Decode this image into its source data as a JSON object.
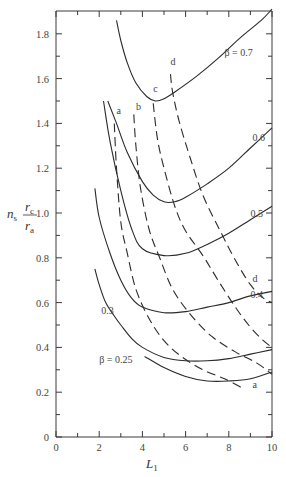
{
  "chart_data": {
    "type": "line",
    "title": "",
    "xlabel": "L_1",
    "ylabel": "n_s r_c / r_a",
    "xlim": [
      0,
      10
    ],
    "ylim": [
      0,
      1.9
    ],
    "grid": false,
    "x_ticks": [
      "0",
      "2",
      "4",
      "6",
      "8",
      "10"
    ],
    "y_ticks": [
      "0",
      "0.2",
      "0.4",
      "0.6",
      "0.8",
      "1.0",
      "1.2",
      "1.4",
      "1.6",
      "1.8"
    ],
    "series": [
      {
        "name": "β = 0.25",
        "style": "solid",
        "label": "β = 0.25",
        "points": [
          [
            4.1,
            0.36
          ],
          [
            5.0,
            0.31
          ],
          [
            6.0,
            0.27
          ],
          [
            7.0,
            0.25
          ],
          [
            8.0,
            0.25
          ],
          [
            9.0,
            0.26
          ],
          [
            10.0,
            0.29
          ]
        ]
      },
      {
        "name": "β = 0.3",
        "style": "solid",
        "label": "0.3",
        "points": [
          [
            1.8,
            0.75
          ],
          [
            2.0,
            0.68
          ],
          [
            2.3,
            0.6
          ],
          [
            2.7,
            0.54
          ],
          [
            3.0,
            0.5
          ],
          [
            3.5,
            0.44
          ],
          [
            4.0,
            0.4
          ],
          [
            5.0,
            0.355
          ],
          [
            6.0,
            0.34
          ],
          [
            7.0,
            0.34
          ],
          [
            8.0,
            0.35
          ],
          [
            9.0,
            0.37
          ],
          [
            10.0,
            0.39
          ]
        ]
      },
      {
        "name": "β = 0.4",
        "style": "solid",
        "label": "0.4",
        "points": [
          [
            1.8,
            1.11
          ],
          [
            2.0,
            0.98
          ],
          [
            2.5,
            0.82
          ],
          [
            3.0,
            0.7
          ],
          [
            3.5,
            0.62
          ],
          [
            4.0,
            0.58
          ],
          [
            5.0,
            0.555
          ],
          [
            6.0,
            0.56
          ],
          [
            7.0,
            0.58
          ],
          [
            8.0,
            0.6
          ],
          [
            9.0,
            0.63
          ],
          [
            10.0,
            0.65
          ]
        ]
      },
      {
        "name": "β = 0.5",
        "style": "solid",
        "label": "0.5",
        "points": [
          [
            2.2,
            1.5
          ],
          [
            2.5,
            1.32
          ],
          [
            3.0,
            1.1
          ],
          [
            3.5,
            0.93
          ],
          [
            4.0,
            0.84
          ],
          [
            5.0,
            0.81
          ],
          [
            6.0,
            0.82
          ],
          [
            7.0,
            0.86
          ],
          [
            8.0,
            0.91
          ],
          [
            9.0,
            0.97
          ],
          [
            10.0,
            1.03
          ]
        ]
      },
      {
        "name": "β = 0.6",
        "style": "solid",
        "label": "0.6",
        "points": [
          [
            2.4,
            1.5
          ],
          [
            2.8,
            1.4
          ],
          [
            3.3,
            1.27
          ],
          [
            4.0,
            1.14
          ],
          [
            4.5,
            1.08
          ],
          [
            5.0,
            1.05
          ],
          [
            5.5,
            1.05
          ],
          [
            6.0,
            1.07
          ],
          [
            7.0,
            1.13
          ],
          [
            8.0,
            1.2
          ],
          [
            9.0,
            1.29
          ],
          [
            10.0,
            1.38
          ]
        ]
      },
      {
        "name": "β = 0.7",
        "style": "solid",
        "label": "β = 0.7",
        "points": [
          [
            2.8,
            1.86
          ],
          [
            3.0,
            1.77
          ],
          [
            3.3,
            1.67
          ],
          [
            3.7,
            1.58
          ],
          [
            4.2,
            1.52
          ],
          [
            4.6,
            1.5
          ],
          [
            5.0,
            1.51
          ],
          [
            5.5,
            1.54
          ],
          [
            6.5,
            1.61
          ],
          [
            7.5,
            1.69
          ],
          [
            8.5,
            1.78
          ],
          [
            9.5,
            1.86
          ],
          [
            10.0,
            1.91
          ]
        ]
      },
      {
        "name": "a",
        "style": "dashed",
        "label": "a",
        "points": [
          [
            2.7,
            1.4
          ],
          [
            2.8,
            1.2
          ],
          [
            3.0,
            0.96
          ],
          [
            3.3,
            0.82
          ],
          [
            3.7,
            0.66
          ],
          [
            4.3,
            0.53
          ],
          [
            5.0,
            0.43
          ],
          [
            5.8,
            0.36
          ],
          [
            6.8,
            0.3
          ],
          [
            7.8,
            0.26
          ],
          [
            8.6,
            0.22
          ]
        ]
      },
      {
        "name": "b",
        "style": "dashed",
        "label": "b",
        "points": [
          [
            3.6,
            1.44
          ],
          [
            3.7,
            1.3
          ],
          [
            3.9,
            1.12
          ],
          [
            4.3,
            0.93
          ],
          [
            4.8,
            0.8
          ],
          [
            5.4,
            0.66
          ],
          [
            6.2,
            0.55
          ],
          [
            7.2,
            0.45
          ],
          [
            8.3,
            0.38
          ],
          [
            9.3,
            0.33
          ],
          [
            10.0,
            0.28
          ]
        ]
      },
      {
        "name": "c",
        "style": "dashed",
        "label": "c",
        "points": [
          [
            4.5,
            1.49
          ],
          [
            4.7,
            1.33
          ],
          [
            5.0,
            1.2
          ],
          [
            5.5,
            1.03
          ],
          [
            6.0,
            0.92
          ],
          [
            6.8,
            0.81
          ],
          [
            7.5,
            0.7
          ],
          [
            8.3,
            0.58
          ],
          [
            9.0,
            0.49
          ],
          [
            9.6,
            0.43
          ],
          [
            10.0,
            0.4
          ]
        ]
      },
      {
        "name": "d",
        "style": "dashed",
        "label": "d",
        "points": [
          [
            5.3,
            1.62
          ],
          [
            5.4,
            1.54
          ],
          [
            5.7,
            1.41
          ],
          [
            6.2,
            1.25
          ],
          [
            6.8,
            1.08
          ],
          [
            7.6,
            0.92
          ],
          [
            8.3,
            0.79
          ],
          [
            9.0,
            0.68
          ],
          [
            9.6,
            0.62
          ],
          [
            10.0,
            0.6
          ]
        ]
      }
    ],
    "annotations": [
      {
        "text": "β = 0.7",
        "x": 7.8,
        "y": 1.7
      },
      {
        "text": "0.6",
        "x": 9.1,
        "y": 1.32
      },
      {
        "text": "0.5",
        "x": 9.0,
        "y": 0.98
      },
      {
        "text": "0.4",
        "x": 9.0,
        "y": 0.62
      },
      {
        "text": "0.3",
        "x": 2.1,
        "y": 0.55
      },
      {
        "text": "β = 0.25",
        "x": 2.0,
        "y": 0.33
      },
      {
        "text": "a",
        "x": 2.8,
        "y": 1.44
      },
      {
        "text": "b",
        "x": 3.7,
        "y": 1.46
      },
      {
        "text": "c",
        "x": 4.5,
        "y": 1.54
      },
      {
        "text": "d",
        "x": 5.3,
        "y": 1.66
      },
      {
        "text": "d",
        "x": 9.1,
        "y": 0.69
      },
      {
        "text": "a",
        "x": 9.1,
        "y": 0.22
      }
    ]
  }
}
